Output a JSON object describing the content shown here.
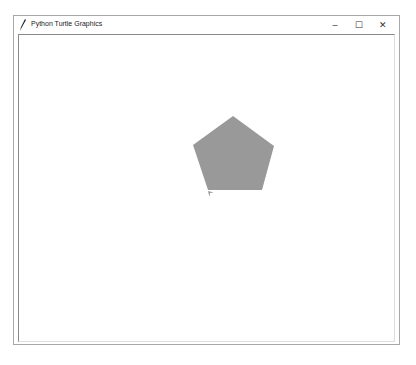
{
  "window": {
    "title": "Python Turtle Graphics",
    "icon": "feather-icon",
    "controls": {
      "minimize": "–",
      "maximize": "☐",
      "close": "✕"
    }
  },
  "canvas": {
    "background": "#ffffff",
    "shape": {
      "type": "pentagon",
      "fill": "#999999",
      "points_page": [
        [
          233,
          116
        ],
        [
          274,
          146
        ],
        [
          262,
          190
        ],
        [
          208,
          190
        ],
        [
          193,
          145
        ]
      ]
    },
    "turtle": {
      "position_page": [
        208,
        191
      ],
      "color": "#999999",
      "shape": "arrow"
    }
  }
}
